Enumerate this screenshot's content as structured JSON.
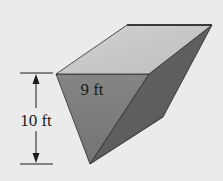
{
  "diagram": {
    "type": "triangular-prism-trough",
    "labels": {
      "width": "9 ft",
      "height": "10 ft"
    },
    "colors": {
      "background": "#ebebeb",
      "top_face": "#c6c6c6",
      "front_face": "#7c7c7c",
      "right_face": "#5f5f5f",
      "edge": "#2a2a2a",
      "dimension_line": "#1a1a1a"
    }
  }
}
